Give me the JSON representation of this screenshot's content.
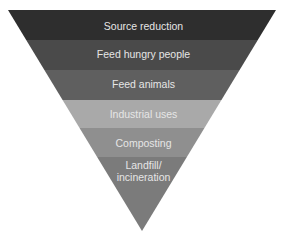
{
  "diagram": {
    "type": "inverted-pyramid",
    "geometry": {
      "top_left_x": 8,
      "top_right_x": 276,
      "top_y": 10,
      "apex_x": 142,
      "apex_y": 231
    },
    "levels": [
      {
        "label": "Source reduction",
        "color": "#2e2e2e",
        "y_top": 10,
        "y_bottom": 40
      },
      {
        "label": "Feed hungry people",
        "color": "#4a4a4a",
        "y_top": 40,
        "y_bottom": 70
      },
      {
        "label": "Feed animals",
        "color": "#5f5f5f",
        "y_top": 70,
        "y_bottom": 100
      },
      {
        "label": "Industrial uses",
        "color": "#a9a9a9",
        "y_top": 100,
        "y_bottom": 128
      },
      {
        "label": "Composting",
        "color": "#8f8f8f",
        "y_top": 128,
        "y_bottom": 157
      },
      {
        "label": "Landfill/\nincineration",
        "color": "#7b7b7b",
        "y_top": 157,
        "y_bottom": 231
      }
    ]
  }
}
